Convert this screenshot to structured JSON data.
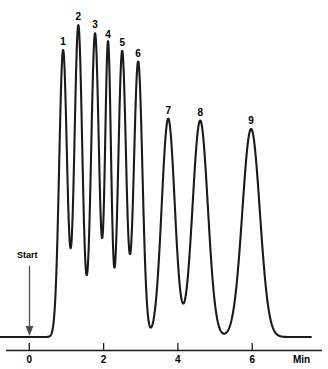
{
  "chart_data": {
    "type": "line",
    "title": "",
    "subtitle": "",
    "xlabel": "Min",
    "ylabel": "",
    "xlim": [
      -0.8,
      7.6
    ],
    "ylim": [
      0,
      100
    ],
    "grid": false,
    "legend": null,
    "x_ticks": [
      0,
      2,
      4,
      6
    ],
    "x_tick_labels": [
      "0",
      "2",
      "4",
      "6"
    ],
    "annotations": [
      {
        "name": "start-marker",
        "label": "Start",
        "x": 0,
        "type": "arrow-down"
      }
    ],
    "series": [
      {
        "name": "chromatogram-trace",
        "color": "#1a1a1a",
        "baseline": 0,
        "peaks": [
          {
            "label": "1",
            "retention_time": 0.91,
            "height": 88.8,
            "width": 0.105
          },
          {
            "label": "2",
            "retention_time": 1.32,
            "height": 96.5,
            "width": 0.105
          },
          {
            "label": "3",
            "retention_time": 1.77,
            "height": 94.0,
            "width": 0.105
          },
          {
            "label": "4",
            "retention_time": 2.12,
            "height": 91.1,
            "width": 0.08
          },
          {
            "label": "5",
            "retention_time": 2.5,
            "height": 88.5,
            "width": 0.105
          },
          {
            "label": "6",
            "retention_time": 2.93,
            "height": 85.3,
            "width": 0.115
          },
          {
            "label": "7",
            "retention_time": 3.74,
            "height": 67.6,
            "width": 0.175
          },
          {
            "label": "8",
            "retention_time": 4.6,
            "height": 67.0,
            "width": 0.205
          },
          {
            "label": "9",
            "retention_time": 5.97,
            "height": 64.4,
            "width": 0.235
          }
        ]
      }
    ],
    "peak_labels": [
      "1",
      "2",
      "3",
      "4",
      "5",
      "6",
      "7",
      "8",
      "9"
    ]
  },
  "axis": {
    "unit_label": "Min",
    "tick_labels": [
      "0",
      "2",
      "4",
      "6"
    ]
  },
  "markers": {
    "start_label": "Start"
  },
  "colors": {
    "trace": "#1a1a1a",
    "axis": "#1a1a1a",
    "marker": "#4d4d4d",
    "background": "#ffffff",
    "text": "#000000"
  }
}
